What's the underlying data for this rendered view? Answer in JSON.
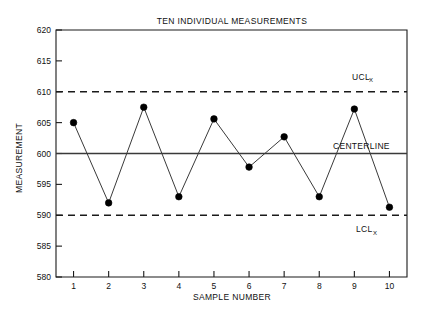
{
  "chart_data": {
    "type": "line",
    "title": "TEN INDIVIDUAL MEASUREMENTS",
    "xlabel": "SAMPLE NUMBER",
    "ylabel": "MEASUREMENT",
    "x": [
      1,
      2,
      3,
      4,
      5,
      6,
      7,
      8,
      9,
      10
    ],
    "categories": [
      "1",
      "2",
      "3",
      "4",
      "5",
      "6",
      "7",
      "8",
      "9",
      "10"
    ],
    "values": [
      605.0,
      592.0,
      607.5,
      593.0,
      605.6,
      597.8,
      602.7,
      593.0,
      607.2,
      591.3
    ],
    "series": [
      {
        "name": "MEASUREMENT",
        "values": [
          605.0,
          592.0,
          607.5,
          593.0,
          605.6,
          597.8,
          602.7,
          593.0,
          607.2,
          591.3
        ]
      }
    ],
    "xlim": [
      0.5,
      10.5
    ],
    "ylim": [
      580,
      620
    ],
    "yticks": [
      580,
      585,
      590,
      595,
      600,
      605,
      610,
      615,
      620
    ],
    "ytick_labels": [
      "580",
      "585",
      "590",
      "595",
      "600",
      "605",
      "610",
      "615",
      "620"
    ],
    "xticks": [
      1,
      2,
      3,
      4,
      5,
      6,
      7,
      8,
      9,
      10
    ],
    "xtick_labels": [
      "1",
      "2",
      "3",
      "4",
      "5",
      "6",
      "7",
      "8",
      "9",
      "10"
    ],
    "grid": false,
    "legend_position": "none",
    "control_limits": {
      "upper": {
        "value": 610,
        "label_main": "UCL",
        "label_sub": "X",
        "style": "dashed"
      },
      "center": {
        "value": 600,
        "label_main": "CENTERLINE",
        "label_sub": "",
        "style": "solid"
      },
      "lower": {
        "value": 590,
        "label_main": "LCL",
        "label_sub": "X",
        "style": "dashed"
      }
    },
    "colors": {
      "axis": "#1a1a1a",
      "line": "#3a3a3a",
      "marker": "#000000",
      "limit": "#1a1a1a",
      "background": "#ffffff"
    }
  }
}
